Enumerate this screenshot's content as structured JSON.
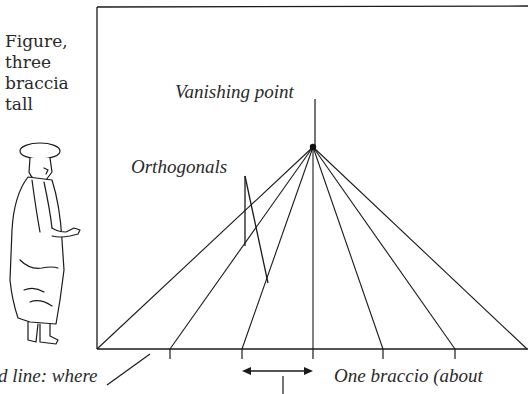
{
  "figure_label": {
    "lines": [
      "Figure,",
      "three",
      "braccia",
      "tall"
    ]
  },
  "labels": {
    "vanishing_point": "Vanishing point",
    "orthogonals": "Orthogonals",
    "ground_line": "d line: where",
    "one_braccio": "One braccio (about"
  },
  "diagram": {
    "vanishing_point": [
      313,
      147
    ],
    "ground_y": 349,
    "base_points_x": [
      97,
      170,
      242,
      313,
      383,
      455,
      525
    ],
    "tick_marks_x": [
      170,
      242,
      313,
      383,
      455
    ],
    "line_color": "#1a1a1a"
  }
}
